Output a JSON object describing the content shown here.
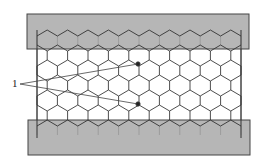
{
  "diagram": {
    "type": "honeycomb-sandwich-structure",
    "components": {
      "top_plate": {
        "x": 27,
        "y": 14,
        "width": 222,
        "height": 35,
        "fill": "#a9a9a9",
        "stroke": "#444444"
      },
      "bottom_plate": {
        "x": 28,
        "y": 120,
        "width": 222,
        "height": 35,
        "fill": "#a9a9a9",
        "stroke": "#444444"
      },
      "core": {
        "left": 37,
        "right": 241,
        "top": 30,
        "bottom": 138,
        "columns": 10,
        "stroke": "#3a3a3a"
      }
    },
    "callout": {
      "label": "1",
      "label_pos": {
        "x": 12,
        "y": 84
      },
      "targets": [
        {
          "x": 138,
          "y": 64
        },
        {
          "x": 138,
          "y": 104
        }
      ]
    }
  }
}
